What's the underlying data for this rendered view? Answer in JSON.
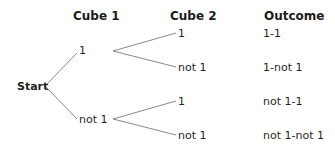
{
  "headers": {
    "cube1": "Cube 1",
    "cube2": "Cube 2",
    "outcome": "Outcome"
  },
  "root": {
    "label": "Start"
  },
  "level1": [
    {
      "label": "1"
    },
    {
      "label": "not 1"
    }
  ],
  "level2": [
    {
      "label": "1",
      "outcome": "1-1"
    },
    {
      "label": "not 1",
      "outcome": "1-not 1"
    },
    {
      "label": "1",
      "outcome": "not 1-1"
    },
    {
      "label": "not 1",
      "outcome": "not 1-not 1"
    }
  ],
  "colors": {
    "branch_line": "#8a8a8a",
    "text": "#1f1f1f",
    "background": "#ffffff"
  }
}
